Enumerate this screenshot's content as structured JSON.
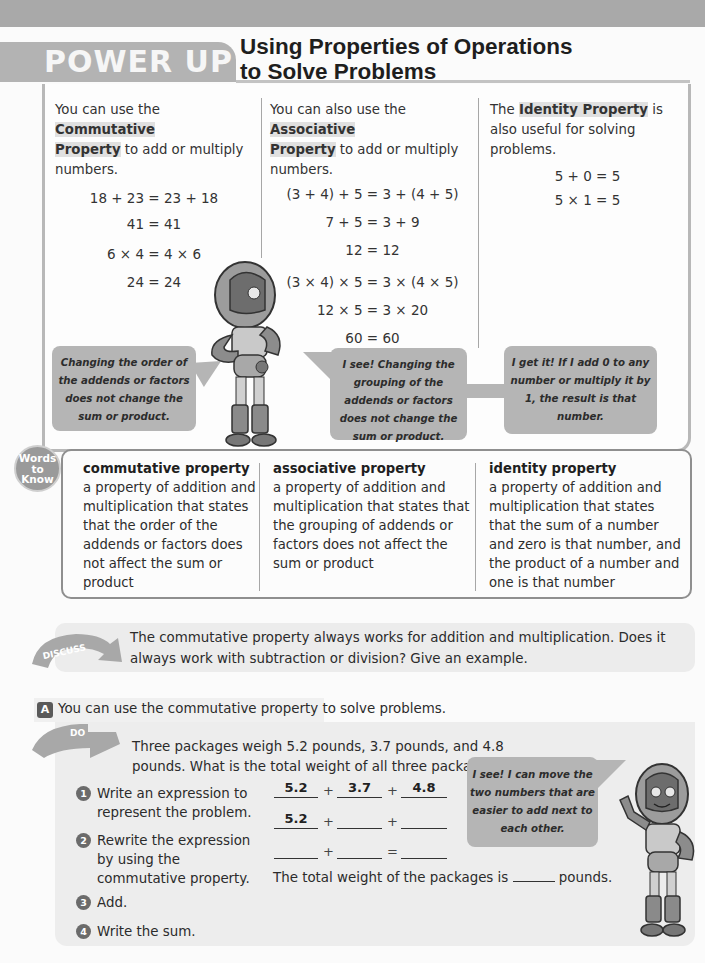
{
  "header": {
    "section_tag": "POWER UP",
    "title_line1": "Using Properties of Operations",
    "title_line2": "to Solve Problems"
  },
  "properties": [
    {
      "lead_pre": "You can use the ",
      "lead_bold1": "Commutative",
      "lead_bold2": "Property",
      "lead_post": " to add or multiply numbers.",
      "equations": [
        "18 + 23 = 23 + 18",
        "41 = 41",
        "6 × 4 = 4 × 6",
        "24 = 24"
      ],
      "bubble": "Changing the order of the addends or factors does not change the sum or product."
    },
    {
      "lead_pre": "You can also use the ",
      "lead_bold1": "Associative",
      "lead_bold2": "Property",
      "lead_post": " to add or multiply numbers.",
      "equations": [
        "(3 + 4) + 5 = 3 + (4 + 5)",
        "7 + 5 = 3 + 9",
        "12 = 12",
        "(3 × 4) × 5 = 3 × (4 × 5)",
        "12 × 5 = 3 × 20",
        "60 = 60"
      ],
      "bubble": "I see! Changing the grouping of the addends or factors does not change the sum or product."
    },
    {
      "lead_pre": "The ",
      "lead_bold1": "Identity Property",
      "lead_post": " is also useful for solving problems.",
      "equations": [
        "5 + 0 = 5",
        "5 × 1 = 5"
      ],
      "bubble": "I get it! If I add 0 to any number or multiply it by 1, the result is that number."
    }
  ],
  "words_to_know": {
    "badge": [
      "Words",
      "to",
      "Know"
    ],
    "terms": [
      {
        "term": "commutative property",
        "definition": "a property of addition and multiplication that states that the order of the addends or factors does not affect the sum or product"
      },
      {
        "term": "associative property",
        "definition": "a property of addition and multiplication that states that the grouping of addends or factors does not affect the sum or product"
      },
      {
        "term": "identity property",
        "definition": "a property of addition and multiplication that states that the sum of a number and zero is that number, and the product of a number and one is that number"
      }
    ]
  },
  "discuss": {
    "tag": "DISCUSS",
    "text": "The commutative property always works for addition and multiplication. Does it always work with subtraction or division? Give an example."
  },
  "activity_a": {
    "badge": "A",
    "intro": "You can use the commutative property to solve problems.",
    "do_tag": "DO",
    "problem": "Three packages weigh 5.2 pounds, 3.7 pounds, and 4.8 pounds. What is the total weight of all three packages",
    "steps": [
      {
        "num": "1",
        "text": "Write an expression to represent the problem."
      },
      {
        "num": "2",
        "text": "Rewrite the expression by using the commutative property."
      },
      {
        "num": "3",
        "text": "Add."
      },
      {
        "num": "4",
        "text": "Write the sum."
      }
    ],
    "expression_row1": [
      "5.2",
      "3.7",
      "4.8"
    ],
    "expression_row2": [
      "5.2",
      "",
      ""
    ],
    "expression_row3": [
      "",
      "",
      ""
    ],
    "ops": {
      "plus": "+",
      "equals": "="
    },
    "total_pre": "The total weight of the packages is",
    "total_post": "pounds.",
    "bubble": "I see! I can move the two numbers that are easier to add next to each other."
  }
}
